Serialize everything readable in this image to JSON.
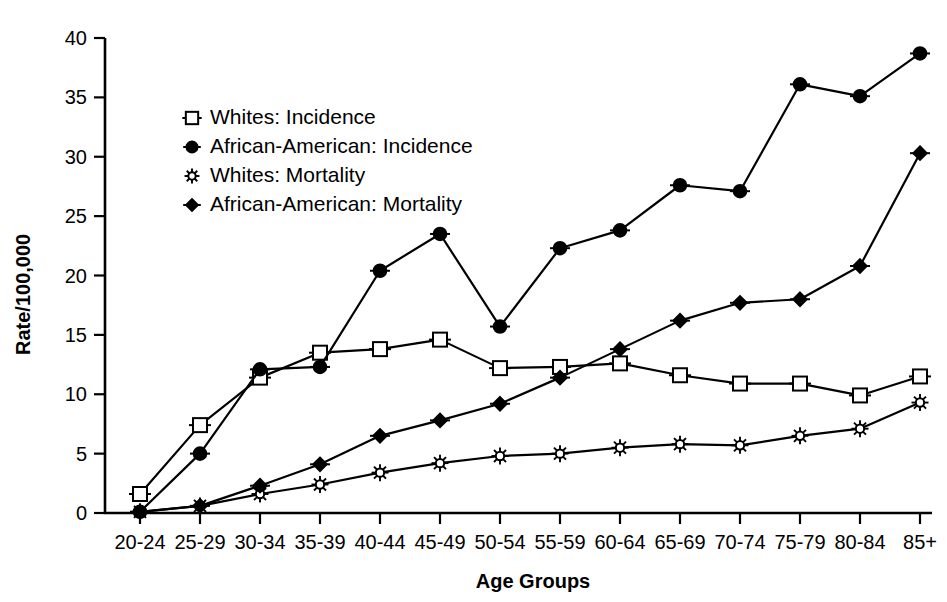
{
  "chart_data": {
    "type": "line",
    "title": "",
    "subtitle": "",
    "xlabel": "Age Groups",
    "ylabel": "Rate/100,000",
    "categories": [
      "20-24",
      "25-29",
      "30-34",
      "35-39",
      "40-44",
      "45-49",
      "50-54",
      "55-59",
      "60-64",
      "65-69",
      "70-74",
      "75-79",
      "80-84",
      "85+"
    ],
    "ylim": [
      0,
      40
    ],
    "yticks": [
      0,
      5,
      10,
      15,
      20,
      25,
      30,
      35,
      40
    ],
    "ytick_labels": [
      "0",
      "5",
      "10",
      "15",
      "20",
      "25",
      "30",
      "35",
      "40"
    ],
    "grid": false,
    "legend_position": "upper-left-inside",
    "series": [
      {
        "name": "Whites: Incidence",
        "marker": "open-square",
        "values": [
          1.6,
          7.4,
          11.4,
          13.5,
          13.8,
          14.6,
          12.2,
          12.3,
          12.6,
          11.6,
          10.9,
          10.9,
          9.9,
          11.5
        ]
      },
      {
        "name": "African-American: Incidence",
        "marker": "filled-circle",
        "values": [
          0.1,
          5.0,
          12.1,
          12.3,
          20.4,
          23.5,
          15.7,
          22.3,
          23.8,
          27.6,
          27.1,
          36.1,
          35.1,
          38.7
        ]
      },
      {
        "name": "Whites: Mortality",
        "marker": "open-star",
        "values": [
          0.1,
          0.6,
          1.6,
          2.4,
          3.4,
          4.2,
          4.8,
          5.0,
          5.5,
          5.8,
          5.7,
          6.5,
          7.1,
          9.3
        ]
      },
      {
        "name": "African-American: Mortality",
        "marker": "filled-diamond",
        "values": [
          0.1,
          0.6,
          2.3,
          4.1,
          6.5,
          7.8,
          9.2,
          11.4,
          13.8,
          16.2,
          17.7,
          18.0,
          20.8,
          30.3
        ]
      }
    ]
  },
  "legend": {
    "items": [
      {
        "label": "Whites: Incidence",
        "marker": "open-square"
      },
      {
        "label": "African-American: Incidence",
        "marker": "filled-circle"
      },
      {
        "label": "Whites: Mortality",
        "marker": "open-star"
      },
      {
        "label": "African-American: Mortality",
        "marker": "filled-diamond"
      }
    ]
  },
  "colors": {
    "foreground": "#000000",
    "background": "#ffffff"
  }
}
